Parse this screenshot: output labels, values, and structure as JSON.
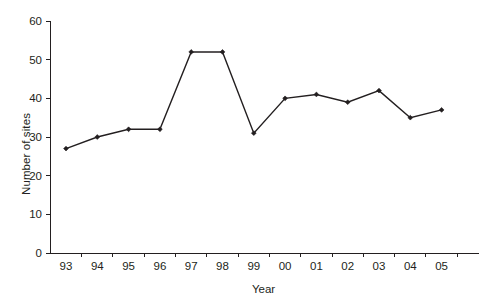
{
  "chart_data": {
    "type": "line",
    "title": "",
    "xlabel": "Year",
    "ylabel": "Number of sites",
    "categories": [
      "93",
      "94",
      "95",
      "96",
      "97",
      "98",
      "99",
      "00",
      "01",
      "02",
      "03",
      "04",
      "05"
    ],
    "values": [
      27,
      30,
      32,
      32,
      52,
      52,
      31,
      40,
      41,
      39,
      42,
      35,
      37
    ],
    "yticks": [
      "0",
      "10",
      "20",
      "30",
      "40",
      "50",
      "60"
    ],
    "ytick_values": [
      0,
      10,
      20,
      30,
      40,
      50,
      60
    ],
    "ylim": [
      0,
      60
    ],
    "grid": false,
    "legend": false,
    "series_color": "#231f20",
    "background_color": "#ffffff",
    "marker": "diamond"
  }
}
